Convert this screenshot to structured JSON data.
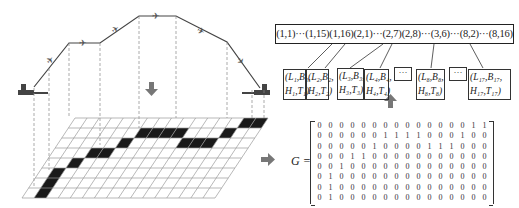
{
  "sequence_box": {
    "text": "(1,1)···(1,15)(1,16)(2,1)···(2,7)(2,8)···(3,6)···(8,2)···(8,16)"
  },
  "nodes": [
    {
      "l1": "(L₁,B₁,",
      "l2": "H₁,T₁)"
    },
    {
      "l1": "(L₂,B₂,",
      "l2": "H₂,T₂)"
    },
    {
      "l1": "(L₃,B₃,",
      "l2": "H₃,T₃)"
    },
    {
      "l1": "(L₄,B₄,",
      "l2": "H₄,T₄)"
    },
    {
      "l1": "(L₈,B₈,",
      "l2": "H₈,T₈)"
    },
    {
      "l1": "(L₁₇,B₁₇,",
      "l2": "H₁₇,T₁₇)"
    }
  ],
  "ellipsis": "···",
  "matrix": {
    "label": "G =",
    "rows": [
      [
        0,
        0,
        0,
        0,
        0,
        0,
        0,
        0,
        0,
        0,
        0,
        0,
        0,
        0,
        1,
        1
      ],
      [
        0,
        0,
        0,
        0,
        0,
        0,
        1,
        1,
        1,
        1,
        0,
        0,
        0,
        1,
        0,
        0
      ],
      [
        0,
        0,
        0,
        0,
        0,
        1,
        0,
        0,
        0,
        0,
        1,
        1,
        1,
        0,
        0,
        0
      ],
      [
        0,
        0,
        0,
        1,
        1,
        0,
        0,
        0,
        0,
        0,
        0,
        0,
        0,
        0,
        0,
        0
      ],
      [
        0,
        0,
        1,
        0,
        0,
        0,
        0,
        0,
        0,
        0,
        0,
        0,
        0,
        0,
        0,
        0
      ],
      [
        0,
        1,
        0,
        0,
        0,
        0,
        0,
        0,
        0,
        0,
        0,
        0,
        0,
        0,
        0,
        0
      ],
      [
        0,
        1,
        0,
        0,
        0,
        0,
        0,
        0,
        0,
        0,
        0,
        0,
        0,
        0,
        0,
        0
      ],
      [
        0,
        1,
        0,
        0,
        0,
        0,
        0,
        0,
        0,
        0,
        0,
        0,
        0,
        0,
        0,
        0
      ]
    ]
  },
  "grid": {
    "rows": 8,
    "cols": 16
  },
  "colors": {
    "line": "#333333",
    "fill": "#1a1a1a",
    "arrow": "#777777"
  }
}
